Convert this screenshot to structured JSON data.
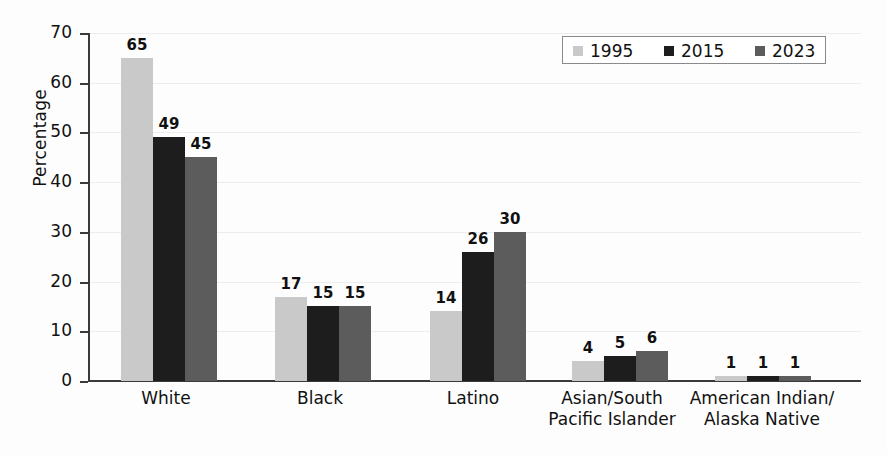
{
  "chart_data": {
    "type": "bar",
    "title": "",
    "xlabel": "",
    "ylabel": "Percentage",
    "ylim": [
      0,
      70
    ],
    "ytick_step": 10,
    "yticks": [
      "0",
      "10",
      "20",
      "30",
      "40",
      "50",
      "60",
      "70"
    ],
    "grid": true,
    "legend_position": "top-right",
    "categories": [
      "White",
      "Black",
      "Latino",
      "Asian/South\nPacific Islander",
      "American Indian/\nAlaska Native"
    ],
    "category_lines": [
      [
        "White"
      ],
      [
        "Black"
      ],
      [
        "Latino"
      ],
      [
        "Asian/South",
        "Pacific Islander"
      ],
      [
        "American Indian/",
        "Alaska Native"
      ]
    ],
    "series": [
      {
        "name": "1995",
        "color": "#c9c9c9",
        "values": [
          65,
          17,
          14,
          4,
          1
        ]
      },
      {
        "name": "2015",
        "color": "#1d1d1d",
        "values": [
          49,
          15,
          26,
          5,
          1
        ]
      },
      {
        "name": "2023",
        "color": "#5c5c5c",
        "values": [
          45,
          15,
          30,
          6,
          1
        ]
      }
    ]
  },
  "legend": {
    "items": [
      {
        "label": "1995",
        "swatch": "legend-swatch-1995"
      },
      {
        "label": "2015",
        "swatch": "legend-swatch-2015"
      },
      {
        "label": "2023",
        "swatch": "legend-swatch-2023"
      }
    ]
  }
}
